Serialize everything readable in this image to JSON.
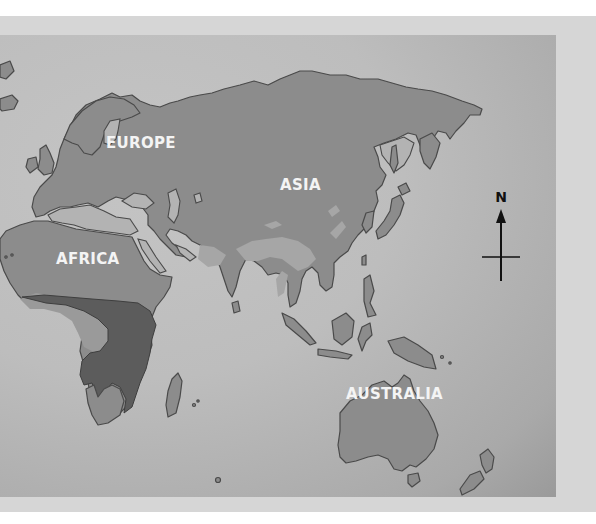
{
  "map": {
    "colors": {
      "land": "#8c8c8c",
      "sea": "#bdbdbd",
      "highlight_region": "#5c5c5c",
      "coastline": "#4a4a4a",
      "label_text": "#f4f4f4"
    },
    "labels": {
      "europe": "EUROPE",
      "asia": "ASIA",
      "africa": "AFRICA",
      "australia": "AUSTRALIA"
    },
    "compass": {
      "north_label": "N"
    }
  }
}
